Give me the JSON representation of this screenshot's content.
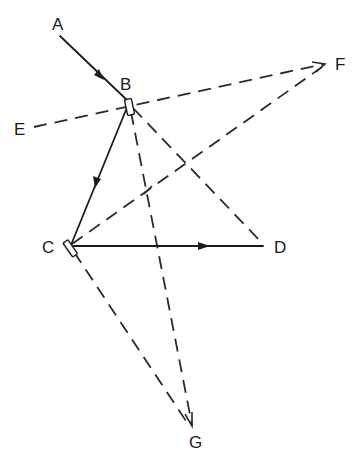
{
  "diagram": {
    "type": "ray-reflection-diagram",
    "points": {
      "A": {
        "label": "A",
        "x": 58,
        "y": 28
      },
      "B": {
        "label": "B",
        "x": 129,
        "y": 101
      },
      "C": {
        "label": "C",
        "x": 70,
        "y": 246
      },
      "D": {
        "label": "D",
        "x": 263,
        "y": 246
      },
      "E": {
        "label": "E",
        "x": 30,
        "y": 128
      },
      "F": {
        "label": "F",
        "x": 326,
        "y": 63
      },
      "G": {
        "label": "G",
        "x": 194,
        "y": 440
      }
    },
    "labels": {
      "A": "A",
      "B": "B",
      "C": "C",
      "D": "D",
      "E": "E",
      "F": "F",
      "G": "G"
    },
    "solid_rays": [
      {
        "from": "A",
        "to": "B",
        "arrow": "midpoint"
      },
      {
        "from": "B",
        "to": "C",
        "arrow": "midpoint"
      },
      {
        "from": "C",
        "to": "D",
        "arrow": "midpoint"
      }
    ],
    "dashed_lines": [
      {
        "from": "E",
        "to": "F"
      },
      {
        "from": "C",
        "to": "F",
        "arrow": "end"
      },
      {
        "from": "B",
        "to": "D"
      },
      {
        "from": "B",
        "to": "G",
        "arrow": "end"
      },
      {
        "from": "C",
        "to": "G",
        "arrow": "end"
      }
    ],
    "mirrors": [
      {
        "at": "B",
        "shape": "small-rectangle"
      },
      {
        "at": "C",
        "shape": "small-rectangle"
      }
    ],
    "colors": {
      "line": "#1c1c1c",
      "background": "#ffffff"
    }
  }
}
